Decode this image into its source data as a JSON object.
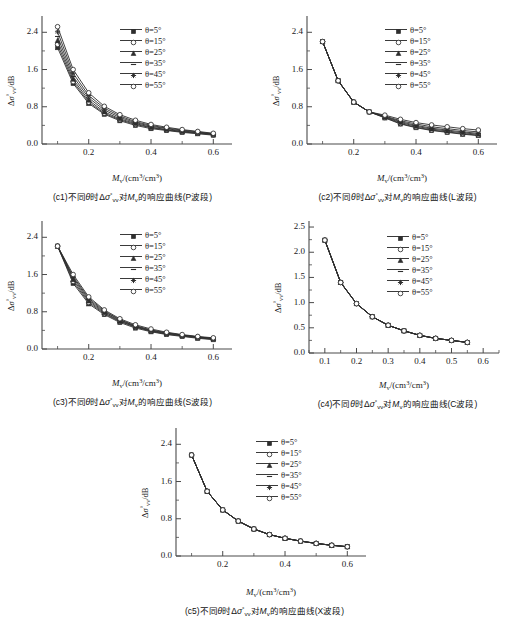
{
  "figure": {
    "axis_color": "#4a4a4a",
    "curve_color": "#2e2e2e",
    "legend_entries": [
      {
        "label": "θ=5°",
        "marker": "filled-square"
      },
      {
        "label": "θ=15°",
        "marker": "open-circle"
      },
      {
        "label": "θ=25°",
        "marker": "filled-triangle"
      },
      {
        "label": "θ=35°",
        "marker": "line-only"
      },
      {
        "label": "θ=45°",
        "marker": "plus-star"
      },
      {
        "label": "θ=55°",
        "marker": "open-circle"
      }
    ],
    "ylabel_text": "Δσ°vv/dB",
    "xlabel_text": "Mv/(cm³/cm³)"
  },
  "chart_data": [
    {
      "id": "c1",
      "type": "line",
      "title": "(c1)不同θ时Δσ°vv对Mv的响应曲线(P波段)",
      "xlabel": "Mv/(cm³/cm³)",
      "ylabel": "Δσ°vv/dB",
      "xlim": [
        0.05,
        0.66
      ],
      "ylim": [
        0.0,
        2.75
      ],
      "xticks": [
        0.2,
        0.4,
        0.6
      ],
      "xtick_labels": [
        "0.2",
        "0.4",
        "0.6"
      ],
      "yticks": [
        0.0,
        0.8,
        1.6,
        2.4
      ],
      "ytick_labels": [
        "0.0",
        "0.8",
        "1.6",
        "2.4"
      ],
      "x": [
        0.1,
        0.15,
        0.2,
        0.25,
        0.3,
        0.35,
        0.4,
        0.45,
        0.5,
        0.55,
        0.6
      ],
      "series": [
        {
          "name": "θ=5°",
          "values": [
            2.07,
            1.3,
            0.87,
            0.64,
            0.5,
            0.4,
            0.33,
            0.29,
            0.25,
            0.22,
            0.19
          ]
        },
        {
          "name": "θ=15°",
          "values": [
            2.14,
            1.34,
            0.9,
            0.66,
            0.52,
            0.42,
            0.35,
            0.3,
            0.26,
            0.23,
            0.2
          ]
        },
        {
          "name": "θ=25°",
          "values": [
            2.22,
            1.39,
            0.94,
            0.69,
            0.54,
            0.44,
            0.36,
            0.31,
            0.27,
            0.24,
            0.21
          ]
        },
        {
          "name": "θ=35°",
          "values": [
            2.31,
            1.45,
            0.99,
            0.73,
            0.57,
            0.46,
            0.38,
            0.33,
            0.28,
            0.25,
            0.21
          ]
        },
        {
          "name": "θ=45°",
          "values": [
            2.41,
            1.52,
            1.04,
            0.77,
            0.6,
            0.48,
            0.4,
            0.34,
            0.3,
            0.26,
            0.22
          ]
        },
        {
          "name": "θ=55°",
          "values": [
            2.52,
            1.6,
            1.1,
            0.81,
            0.63,
            0.51,
            0.42,
            0.36,
            0.31,
            0.27,
            0.23
          ]
        }
      ]
    },
    {
      "id": "c2",
      "type": "line",
      "title": "(c2)不同θ时Δσ°vv对Mv的响应曲线(L波段)",
      "xlabel": "Mv/(cm³/cm³)",
      "ylabel": "Δσ°vv/dB",
      "xlim": [
        0.05,
        0.66
      ],
      "ylim": [
        0.0,
        2.75
      ],
      "xticks": [
        0.2,
        0.4,
        0.6
      ],
      "xtick_labels": [
        "0.2",
        "0.4",
        "0.6"
      ],
      "yticks": [
        0.0,
        0.8,
        1.6,
        2.4
      ],
      "ytick_labels": [
        "0.0",
        "0.8",
        "1.6",
        "2.4"
      ],
      "x": [
        0.1,
        0.15,
        0.2,
        0.25,
        0.3,
        0.35,
        0.4,
        0.45,
        0.5,
        0.55,
        0.6
      ],
      "series": [
        {
          "name": "θ=5°",
          "values": [
            2.2,
            1.36,
            0.9,
            0.69,
            0.56,
            0.43,
            0.35,
            0.29,
            0.25,
            0.21,
            0.18
          ]
        },
        {
          "name": "θ=15°",
          "values": [
            2.2,
            1.36,
            0.9,
            0.69,
            0.57,
            0.44,
            0.36,
            0.3,
            0.26,
            0.22,
            0.19
          ]
        },
        {
          "name": "θ=25°",
          "values": [
            2.2,
            1.36,
            0.9,
            0.69,
            0.58,
            0.46,
            0.38,
            0.32,
            0.28,
            0.24,
            0.21
          ]
        },
        {
          "name": "θ=35°",
          "values": [
            2.2,
            1.36,
            0.9,
            0.69,
            0.59,
            0.48,
            0.4,
            0.34,
            0.3,
            0.26,
            0.23
          ]
        },
        {
          "name": "θ=45°",
          "values": [
            2.2,
            1.36,
            0.9,
            0.69,
            0.6,
            0.5,
            0.43,
            0.37,
            0.33,
            0.29,
            0.26
          ]
        },
        {
          "name": "θ=55°",
          "values": [
            2.2,
            1.36,
            0.9,
            0.69,
            0.62,
            0.53,
            0.46,
            0.41,
            0.37,
            0.33,
            0.3
          ]
        }
      ]
    },
    {
      "id": "c3",
      "type": "line",
      "title": "(c3)不同θ时Δσ°vv对Mv的响应曲线(S波段)",
      "xlabel": "Mv/(cm³/cm³)",
      "ylabel": "Δσ°vv/dB",
      "xlim": [
        0.05,
        0.66
      ],
      "ylim": [
        0.0,
        2.75
      ],
      "xticks": [
        0.2,
        0.4,
        0.6
      ],
      "xtick_labels": [
        "0.2",
        "0.4",
        "0.6"
      ],
      "yticks": [
        0.0,
        0.8,
        1.6,
        2.4
      ],
      "ytick_labels": [
        "0.0",
        "0.8",
        "1.6",
        "2.4"
      ],
      "x": [
        0.1,
        0.15,
        0.2,
        0.25,
        0.3,
        0.35,
        0.4,
        0.45,
        0.5,
        0.55,
        0.6
      ],
      "series": [
        {
          "name": "θ=5°",
          "values": [
            2.21,
            1.41,
            0.97,
            0.74,
            0.57,
            0.45,
            0.37,
            0.31,
            0.27,
            0.23,
            0.2
          ]
        },
        {
          "name": "θ=15°",
          "values": [
            2.21,
            1.45,
            1.0,
            0.76,
            0.59,
            0.47,
            0.38,
            0.32,
            0.28,
            0.24,
            0.21
          ]
        },
        {
          "name": "θ=25°",
          "values": [
            2.21,
            1.49,
            1.03,
            0.78,
            0.6,
            0.48,
            0.39,
            0.33,
            0.29,
            0.25,
            0.22
          ]
        },
        {
          "name": "θ=35°",
          "values": [
            2.21,
            1.53,
            1.06,
            0.8,
            0.62,
            0.49,
            0.4,
            0.34,
            0.3,
            0.26,
            0.22
          ]
        },
        {
          "name": "θ=45°",
          "values": [
            2.21,
            1.56,
            1.09,
            0.82,
            0.63,
            0.5,
            0.41,
            0.35,
            0.3,
            0.26,
            0.23
          ]
        },
        {
          "name": "θ=55°",
          "values": [
            2.21,
            1.6,
            1.12,
            0.84,
            0.65,
            0.52,
            0.43,
            0.36,
            0.31,
            0.27,
            0.24
          ]
        }
      ]
    },
    {
      "id": "c4",
      "type": "line",
      "title": "(c4)不同θ时Δσ°vv对Mv的响应曲线(C波段)",
      "xlabel": "Mv/(cm³/cm³)",
      "ylabel": "Δσ°vv/dB",
      "xlim": [
        0.05,
        0.65
      ],
      "ylim": [
        0.0,
        2.62
      ],
      "xticks": [
        0.1,
        0.2,
        0.3,
        0.4,
        0.5,
        0.6
      ],
      "xtick_labels": [
        "0.1",
        "0.2",
        "0.3",
        "0.4",
        "0.5",
        "0.6"
      ],
      "yticks": [
        0.0,
        0.5,
        1.0,
        1.5,
        2.0,
        2.5
      ],
      "ytick_labels": [
        "0.0",
        "0.5",
        "1.0",
        "1.5",
        "2.0",
        "2.5"
      ],
      "x": [
        0.1,
        0.15,
        0.2,
        0.25,
        0.3,
        0.35,
        0.4,
        0.45,
        0.5,
        0.55
      ],
      "series": [
        {
          "name": "θ=5°",
          "values": [
            2.24,
            1.4,
            0.98,
            0.72,
            0.55,
            0.44,
            0.35,
            0.29,
            0.25,
            0.21
          ]
        },
        {
          "name": "θ=15°",
          "values": [
            2.24,
            1.4,
            0.98,
            0.72,
            0.55,
            0.44,
            0.35,
            0.29,
            0.25,
            0.21
          ]
        },
        {
          "name": "θ=25°",
          "values": [
            2.24,
            1.4,
            0.98,
            0.72,
            0.55,
            0.44,
            0.35,
            0.29,
            0.25,
            0.21
          ]
        },
        {
          "name": "θ=35°",
          "values": [
            2.24,
            1.4,
            0.98,
            0.72,
            0.55,
            0.44,
            0.35,
            0.29,
            0.25,
            0.21
          ]
        },
        {
          "name": "θ=45°",
          "values": [
            2.24,
            1.4,
            0.98,
            0.72,
            0.55,
            0.44,
            0.35,
            0.29,
            0.25,
            0.21
          ]
        },
        {
          "name": "θ=55°",
          "values": [
            2.24,
            1.4,
            0.98,
            0.72,
            0.55,
            0.44,
            0.35,
            0.29,
            0.25,
            0.21
          ]
        }
      ]
    },
    {
      "id": "c5",
      "type": "line",
      "title": "(c5)不同θ时Δσ°vv对Mv的响应曲线(X波段)",
      "xlabel": "Mv/(cm³/cm³)",
      "ylabel": "Δσ°vv/dB",
      "xlim": [
        0.05,
        0.66
      ],
      "ylim": [
        0.0,
        2.75
      ],
      "xticks": [
        0.2,
        0.4,
        0.6
      ],
      "xtick_labels": [
        "0.2",
        "0.4",
        "0.6"
      ],
      "yticks": [
        0.0,
        0.8,
        1.6,
        2.4
      ],
      "ytick_labels": [
        "0.0",
        "0.8",
        "1.6",
        "2.4"
      ],
      "x": [
        0.1,
        0.15,
        0.2,
        0.25,
        0.3,
        0.35,
        0.4,
        0.45,
        0.5,
        0.55,
        0.6
      ],
      "series": [
        {
          "name": "θ=5°",
          "values": [
            2.17,
            1.39,
            0.99,
            0.75,
            0.58,
            0.46,
            0.38,
            0.32,
            0.27,
            0.23,
            0.2
          ]
        },
        {
          "name": "θ=15°",
          "values": [
            2.17,
            1.39,
            0.99,
            0.75,
            0.58,
            0.46,
            0.38,
            0.32,
            0.27,
            0.23,
            0.2
          ]
        },
        {
          "name": "θ=25°",
          "values": [
            2.17,
            1.39,
            0.99,
            0.75,
            0.58,
            0.46,
            0.38,
            0.32,
            0.27,
            0.23,
            0.2
          ]
        },
        {
          "name": "θ=35°",
          "values": [
            2.17,
            1.39,
            0.99,
            0.75,
            0.58,
            0.46,
            0.38,
            0.32,
            0.27,
            0.23,
            0.2
          ]
        },
        {
          "name": "θ=45°",
          "values": [
            2.17,
            1.39,
            0.99,
            0.75,
            0.58,
            0.46,
            0.38,
            0.32,
            0.27,
            0.23,
            0.2
          ]
        },
        {
          "name": "θ=55°",
          "values": [
            2.17,
            1.39,
            0.99,
            0.75,
            0.58,
            0.46,
            0.38,
            0.32,
            0.27,
            0.23,
            0.2
          ]
        }
      ]
    }
  ]
}
